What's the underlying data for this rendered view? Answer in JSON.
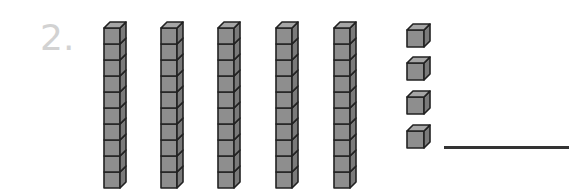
{
  "problem": {
    "number_label": "2.",
    "answer_value": "",
    "tens_rods": 5,
    "ones_cubes": 4,
    "cubes_per_rod": 10
  },
  "layout": {
    "rod_x": [
      104,
      161,
      218,
      276,
      334
    ],
    "rod_top": 28,
    "cube_size": 16,
    "depth": 6,
    "unit_x": 407,
    "unit_y": [
      30,
      63,
      97,
      131
    ],
    "unit_size": 17
  },
  "colors": {
    "cube_front": "#8e8e8e",
    "cube_top": "#a6a6a6",
    "cube_side": "#7a7a7a",
    "outline": "#222222",
    "label": "#d2d2d2"
  }
}
